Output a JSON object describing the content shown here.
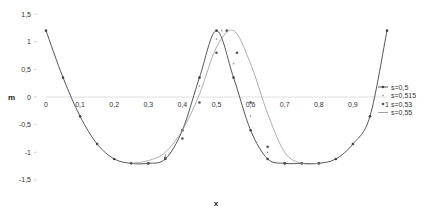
{
  "chart_data": {
    "type": "line",
    "title": "",
    "xlabel": "x",
    "ylabel": "m",
    "xlim": [
      0,
      1
    ],
    "ylim": [
      -1.5,
      1.5
    ],
    "grid": false,
    "legend_position": "right",
    "x_ticks": [
      "0",
      "0,1",
      "0,2",
      "0,3",
      "0,4",
      "0,5",
      "0,6",
      "0,7",
      "0,8",
      "0,9",
      "1"
    ],
    "y_ticks": [
      "1,5",
      "1",
      "0,5",
      "0",
      "-0,5",
      "-1",
      "-1,5"
    ],
    "series": [
      {
        "name": "s=0,5",
        "marker": "dot-line",
        "color": "#444444",
        "x": [
          0,
          0.05,
          0.1,
          0.15,
          0.2,
          0.25,
          0.3,
          0.35,
          0.4,
          0.45,
          0.5,
          0.55,
          0.6,
          0.65,
          0.7,
          0.75,
          0.8,
          0.85,
          0.9,
          0.95,
          1
        ],
        "values": [
          1.2,
          0.35,
          -0.35,
          -0.85,
          -1.12,
          -1.2,
          -1.2,
          -1.12,
          -0.6,
          0.35,
          1.2,
          0.35,
          -0.6,
          -1.12,
          -1.2,
          -1.2,
          -1.2,
          -1.12,
          -0.85,
          -0.35,
          1.2
        ]
      },
      {
        "name": "s=0,515",
        "marker": "small-dot",
        "color": "#888888",
        "x": [
          0.3,
          0.35,
          0.4,
          0.45,
          0.5,
          0.515,
          0.55,
          0.6,
          0.65,
          0.7,
          0.75,
          0.8
        ],
        "values": [
          -1.2,
          -1.05,
          -0.6,
          0.2,
          1.05,
          1.2,
          0.6,
          -0.35,
          -1.0,
          -1.2,
          -1.2,
          -1.2
        ]
      },
      {
        "name": "s=0,53",
        "marker": "dot",
        "color": "#555555",
        "x": [
          0.3,
          0.35,
          0.4,
          0.45,
          0.5,
          0.53,
          0.56,
          0.6,
          0.65,
          0.7,
          0.75,
          0.8
        ],
        "values": [
          -1.2,
          -1.1,
          -0.75,
          -0.1,
          0.8,
          1.2,
          0.8,
          -0.1,
          -0.9,
          -1.2,
          -1.2,
          -1.2
        ]
      },
      {
        "name": "s=0,55",
        "marker": "line",
        "color": "#999999",
        "x": [
          0.25,
          0.3,
          0.35,
          0.4,
          0.45,
          0.5,
          0.55,
          0.6,
          0.65,
          0.7,
          0.75,
          0.8
        ],
        "values": [
          -1.2,
          -1.15,
          -1.0,
          -0.6,
          0.05,
          0.9,
          1.2,
          0.6,
          -0.3,
          -1.0,
          -1.2,
          -1.2
        ]
      }
    ]
  }
}
